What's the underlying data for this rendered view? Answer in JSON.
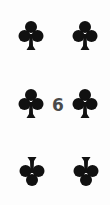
{
  "card": {
    "rank": "6",
    "suit": "clubs",
    "suit_color": "#111111",
    "rank_color": "#4a4a4a",
    "pips": [
      {
        "name": "club-icon",
        "x": 18,
        "y": 20,
        "inverted": false
      },
      {
        "name": "club-icon",
        "x": 72,
        "y": 20,
        "inverted": false
      },
      {
        "name": "club-icon",
        "x": 18,
        "y": 88,
        "inverted": false
      },
      {
        "name": "club-icon",
        "x": 72,
        "y": 88,
        "inverted": false
      },
      {
        "name": "club-icon",
        "x": 19,
        "y": 155,
        "inverted": true
      },
      {
        "name": "club-icon",
        "x": 73,
        "y": 155,
        "inverted": true
      }
    ]
  }
}
